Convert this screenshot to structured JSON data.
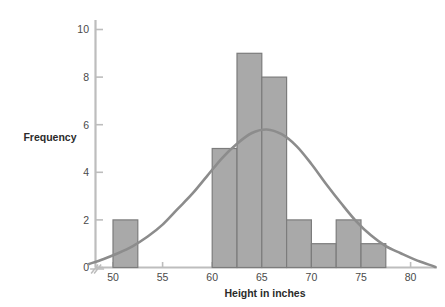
{
  "chart_data": {
    "type": "bar",
    "title": "",
    "subtitle": "",
    "xlabel": "Height in inches",
    "ylabel": "Frequency",
    "xlim": [
      47.5,
      82.5
    ],
    "ylim": [
      0,
      10.5
    ],
    "x_ticks": [
      50,
      55,
      60,
      65,
      70,
      75,
      80
    ],
    "x_tick_labels": [
      "50",
      "55",
      "60",
      "65",
      "70",
      "75",
      "80"
    ],
    "y_ticks": [
      0,
      2,
      4,
      6,
      8,
      10
    ],
    "y_tick_labels": [
      "0",
      "2",
      "4",
      "6",
      "8",
      "10"
    ],
    "grid": false,
    "legend": "none",
    "bin_width": 2.5,
    "bin_edges": [
      50,
      52.5,
      60,
      62.5,
      65,
      67.5,
      70,
      72.5,
      75,
      77.5
    ],
    "bars": [
      {
        "bin_start": 50,
        "bin_end": 52.5,
        "value": 2
      },
      {
        "bin_start": 60,
        "bin_end": 62.5,
        "value": 5
      },
      {
        "bin_start": 62.5,
        "bin_end": 65,
        "value": 9
      },
      {
        "bin_start": 65,
        "bin_end": 67.5,
        "value": 8
      },
      {
        "bin_start": 67.5,
        "bin_end": 70,
        "value": 2
      },
      {
        "bin_start": 70,
        "bin_end": 72.5,
        "value": 1
      },
      {
        "bin_start": 72.5,
        "bin_end": 75,
        "value": 2
      },
      {
        "bin_start": 75,
        "bin_end": 77.5,
        "value": 1
      }
    ],
    "categories": [
      "50-52.5",
      "60-62.5",
      "62.5-65",
      "65-67.5",
      "67.5-70",
      "70-72.5",
      "72.5-75",
      "75-77.5"
    ],
    "values": [
      2,
      5,
      9,
      8,
      2,
      1,
      2,
      1
    ],
    "overlay_curve": {
      "name": "normal-curve",
      "mean": 65.5,
      "peak_value": 5.8,
      "points": [
        [
          47.6,
          0.15
        ],
        [
          49.0,
          0.35
        ],
        [
          50.5,
          0.6
        ],
        [
          52.0,
          0.9
        ],
        [
          53.5,
          1.3
        ],
        [
          55.0,
          1.8
        ],
        [
          56.5,
          2.45
        ],
        [
          58.0,
          3.1
        ],
        [
          59.5,
          3.85
        ],
        [
          61.0,
          4.6
        ],
        [
          62.5,
          5.2
        ],
        [
          64.0,
          5.65
        ],
        [
          65.5,
          5.8
        ],
        [
          67.0,
          5.6
        ],
        [
          68.5,
          5.1
        ],
        [
          70.0,
          4.35
        ],
        [
          71.5,
          3.5
        ],
        [
          73.0,
          2.7
        ],
        [
          74.5,
          1.95
        ],
        [
          76.0,
          1.35
        ],
        [
          77.5,
          0.9
        ],
        [
          79.0,
          0.6
        ],
        [
          80.5,
          0.32
        ],
        [
          82.0,
          0.1
        ],
        [
          82.5,
          0.02
        ]
      ]
    },
    "axis_break": {
      "present": true,
      "axis": "x",
      "position": 48.6
    }
  },
  "colors": {
    "bar_fill": "#a9a9a9",
    "bar_stroke": "#7c7c7c",
    "curve": "#8c8c8c",
    "axis": "#bdbdbd",
    "tick_text": "#4a4a4a",
    "title_text": "#2b2b2b",
    "background": "#ffffff"
  },
  "icons": {
    "axis_break": "axis-break-icon"
  }
}
